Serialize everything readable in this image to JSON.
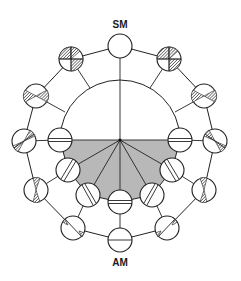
{
  "diagram": {
    "top_label": "SM",
    "bottom_label": "AM",
    "colors": {
      "line": "#222222",
      "shaded_sector": "#b8b8b8",
      "background": "#ffffff"
    },
    "outer_ring_nodes": [
      {
        "id": "SM",
        "pattern": "empty"
      },
      {
        "id": "upper-right-1",
        "pattern": "hatched-quadrants"
      },
      {
        "id": "upper-right-2",
        "pattern": "hatched-bowtie"
      },
      {
        "id": "right-mid",
        "pattern": "hatched-wedge"
      },
      {
        "id": "lower-right-1",
        "pattern": "narrow-hourglass"
      },
      {
        "id": "lower-right-2",
        "pattern": "diagonal-line-small-hatch"
      },
      {
        "id": "AM",
        "pattern": "horizontal-line"
      },
      {
        "id": "lower-left-2",
        "pattern": "diagonal-line-small-hatch"
      },
      {
        "id": "lower-left-1",
        "pattern": "narrow-hourglass"
      },
      {
        "id": "left-mid",
        "pattern": "hatched-wedge"
      },
      {
        "id": "upper-left-2",
        "pattern": "hatched-bowtie"
      },
      {
        "id": "upper-left-1",
        "pattern": "hatched-quadrants"
      }
    ],
    "inner_ring_nodes": [
      {
        "id": "inner-left-0",
        "pattern": "double-horizontal"
      },
      {
        "id": "inner-left-1",
        "pattern": "double-diagonal"
      },
      {
        "id": "inner-left-2",
        "pattern": "double-diagonal"
      },
      {
        "id": "inner-bottom",
        "pattern": "double-horizontal"
      },
      {
        "id": "inner-right-2",
        "pattern": "double-diagonal"
      },
      {
        "id": "inner-right-1",
        "pattern": "double-diagonal"
      },
      {
        "id": "inner-right-0",
        "pattern": "double-horizontal"
      }
    ]
  }
}
